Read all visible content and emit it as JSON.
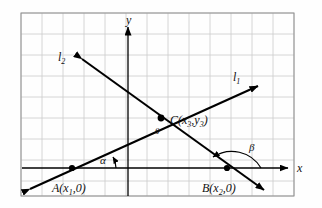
{
  "figure": {
    "type": "geometry-diagram",
    "background_grid": {
      "visible": true,
      "cell_size_px": 21,
      "color": "#c9c9c9",
      "border_color": "#8a8a8a"
    },
    "axes": {
      "x_label": "x",
      "y_label": "y",
      "color": "#000000",
      "arrowheads": true
    },
    "lines": [
      {
        "name": "l1",
        "label": "l₁",
        "label_sub": "1",
        "label_base": "l",
        "direction": "up-right",
        "slope_sign": "positive",
        "label_pos": {
          "x": 237,
          "y": 77
        }
      },
      {
        "name": "l2",
        "label": "l₂",
        "label_sub": "2",
        "label_base": "l",
        "direction": "down-right",
        "slope_sign": "negative",
        "label_pos": {
          "x": 64,
          "y": 57
        }
      }
    ],
    "points": [
      {
        "name": "A",
        "label_base": "A",
        "label": "A(x₁, 0)",
        "sub": "1",
        "second": "0",
        "px": {
          "x": 72,
          "y": 168
        }
      },
      {
        "name": "B",
        "label_base": "B",
        "label": "B(x₂, 0)",
        "sub": "2",
        "second": "0",
        "px": {
          "x": 227,
          "y": 168
        }
      },
      {
        "name": "C",
        "label_base": "C",
        "label": "C(x₃, y₃)",
        "sub": "3",
        "second": "y₃",
        "px": {
          "x": 161,
          "y": 118
        }
      }
    ],
    "angles": [
      {
        "name": "alpha",
        "glyph": "α",
        "at_point": "A",
        "between": "x-axis and l1",
        "label_pos": {
          "x": 104,
          "y": 160
        }
      },
      {
        "name": "beta",
        "glyph": "β",
        "at_point": "B",
        "between": "x-axis and l2",
        "label_pos": {
          "x": 252,
          "y": 147
        }
      },
      {
        "name": "theta",
        "glyph": "θ",
        "at_point": "C",
        "between": "l1 and l2",
        "label_pos": {
          "x": 158,
          "y": 130
        }
      }
    ]
  }
}
